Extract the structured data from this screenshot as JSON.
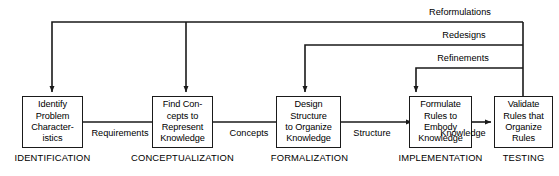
{
  "diagram": {
    "type": "process-flow",
    "line_color": "#1a1a1a",
    "background_color": "#ffffff",
    "text_color": "#000000",
    "stages": [
      {
        "id": "identification",
        "box_text": "Identify\nProblem\nCharacter-\nistics",
        "phase_label": "IDENTIFICATION"
      },
      {
        "id": "conceptualization",
        "box_text": "Find Con-\ncepts to\nRepresent\nKnowledge",
        "phase_label": "CONCEPTUALIZATION"
      },
      {
        "id": "formalization",
        "box_text": "Design\nStructure\nto Organize\nKnowledge",
        "phase_label": "FORMALIZATION"
      },
      {
        "id": "implementation",
        "box_text": "Formulate\nRules to\nEmbody\nKnowledge",
        "phase_label": "IMPLEMENTATION"
      },
      {
        "id": "testing",
        "box_text": "Validate\nRules that\nOrganize\nRules",
        "phase_label": "TESTING"
      }
    ],
    "flow_labels": [
      {
        "id": "requirements",
        "label": "Requirements"
      },
      {
        "id": "concepts",
        "label": "Concepts"
      },
      {
        "id": "structure",
        "label": "Structure"
      },
      {
        "id": "knowledge",
        "label": "Knowledge"
      }
    ],
    "feedback_labels": [
      {
        "id": "reformulations",
        "label": "Reformulations"
      },
      {
        "id": "redesigns",
        "label": "Redesigns"
      },
      {
        "id": "refinements",
        "label": "Refinements"
      }
    ]
  }
}
